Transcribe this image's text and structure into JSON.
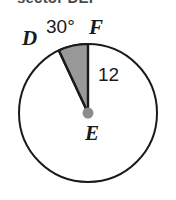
{
  "heading": {
    "text": "sector DEF",
    "note": "clipped at top edge of image"
  },
  "figure": {
    "name": "circle-with-shaded-sector",
    "points": {
      "center_label": "E",
      "arc_start_label": "D",
      "arc_end_label": "F"
    },
    "angle_label": "30°",
    "radius_label": "12",
    "colors": {
      "stroke": "#1a1a1a",
      "sector_fill": "#999999",
      "center_dot": "#8c8c8c",
      "background": "#ffffff",
      "heading_text": "#4a4a4a"
    },
    "geometry": {
      "center_x": 88,
      "center_y": 113,
      "radius": 69,
      "sector_start_deg": 115,
      "sector_end_deg": 90
    }
  }
}
